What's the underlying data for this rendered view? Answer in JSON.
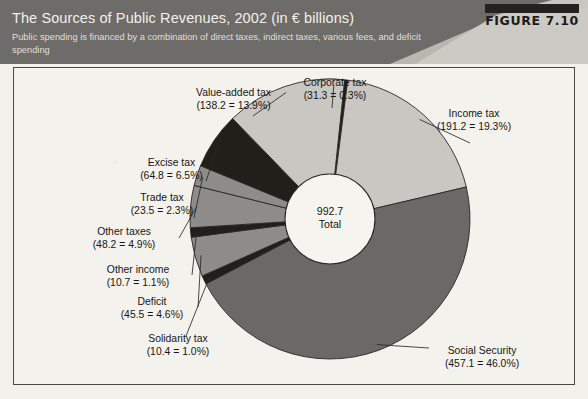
{
  "header": {
    "title": "The Sources of Public Revenues, 2002 (in € billions)",
    "subtitle": "Public spending is financed by a combination of direct taxes, indirect taxes, various fees, and deficit spending",
    "figure_label": "FIGURE 7.10"
  },
  "center": {
    "value": "992.7",
    "caption": "Total"
  },
  "colors": {
    "header_bg": "#6e6c68",
    "header_accent": "#bebbb4",
    "panel_bg": "#f4f2ed",
    "panel_border": "#4a4845",
    "slice_light": "#c9c7c2",
    "slice_black": "#221f1b",
    "slice_mid": "#8e8c88",
    "slice_dark": "#6b6966",
    "hole": "#f6f4ef",
    "outline": "#2a2825",
    "leader": "#2a2825",
    "text": "#181614"
  },
  "chart_data": {
    "type": "pie",
    "variant": "donut",
    "title": "The Sources of Public Revenues, 2002 (in € billions)",
    "subtitle": "Public spending is financed by a combination of direct taxes, indirect taxes, various fees, and deficit spending",
    "units": "€ billions",
    "total": 992.7,
    "total_caption": "Total",
    "legend": "none",
    "labels_position": "outside-with-leader-lines",
    "start_angle_deg": -4,
    "direction": "clockwise",
    "slices": [
      {
        "name": "Corporate tax",
        "value": 31.3,
        "percent": 0.3,
        "label": "Corporate tax",
        "value_text": "(31.3 = 0.3%)",
        "fill": "black",
        "start_deg": -4.0,
        "sweep_deg": 11.3
      },
      {
        "name": "Income tax",
        "value": 191.2,
        "percent": 19.3,
        "label": "Income tax",
        "value_text": "(191.2 = 19.3%)",
        "fill": "light",
        "start_deg": 7.3,
        "sweep_deg": 69.5
      },
      {
        "name": "Social Security",
        "value": 457.1,
        "percent": 46.0,
        "label": "Social Security",
        "value_text": "(457.1 = 46.0%)",
        "fill": "dark",
        "start_deg": 76.8,
        "sweep_deg": 165.6
      },
      {
        "name": "Solidarity tax",
        "value": 10.4,
        "percent": 1.0,
        "label": "Solidarity tax",
        "value_text": "(10.4 = 1.0%)",
        "fill": "black",
        "start_deg": 242.4,
        "sweep_deg": 3.6
      },
      {
        "name": "Deficit",
        "value": 45.5,
        "percent": 4.6,
        "label": "Deficit",
        "value_text": "(45.5 = 4.6%)",
        "fill": "mid",
        "start_deg": 246.0,
        "sweep_deg": 16.5
      },
      {
        "name": "Other income",
        "value": 10.7,
        "percent": 1.1,
        "label": "Other income",
        "value_text": "(10.7 = 1.1%)",
        "fill": "black",
        "start_deg": 262.5,
        "sweep_deg": 3.9
      },
      {
        "name": "Other taxes",
        "value": 48.2,
        "percent": 4.9,
        "label": "Other taxes",
        "value_text": "(48.2 = 4.9%)",
        "fill": "mid",
        "start_deg": 266.4,
        "sweep_deg": 17.5
      },
      {
        "name": "Trade tax",
        "value": 23.5,
        "percent": 2.3,
        "label": "Trade tax",
        "value_text": "(23.5 = 2.3%)",
        "fill": "mid",
        "start_deg": 283.9,
        "sweep_deg": 8.5
      },
      {
        "name": "Excise tax",
        "value": 64.8,
        "percent": 6.5,
        "label": "Excise tax",
        "value_text": "(64.8 = 6.5%)",
        "fill": "black",
        "start_deg": 292.4,
        "sweep_deg": 23.5
      },
      {
        "name": "Value-added tax",
        "value": 138.2,
        "percent": 13.9,
        "label": "Value-added tax",
        "value_text": "(138.2 = 13.9%)",
        "fill": "light",
        "start_deg": 315.9,
        "sweep_deg": 50.1
      }
    ]
  },
  "callouts": {
    "value_added_tax": {
      "label": "Value-added tax",
      "value_text": "(138.2 = 13.9%)"
    },
    "excise_tax": {
      "label": "Excise tax",
      "value_text": "(64.8 = 6.5%)"
    },
    "trade_tax": {
      "label": "Trade tax",
      "value_text": "(23.5 = 2.3%)"
    },
    "other_taxes": {
      "label": "Other taxes",
      "value_text": "(48.2 = 4.9%)"
    },
    "other_income": {
      "label": "Other income",
      "value_text": "(10.7 = 1.1%)"
    },
    "deficit": {
      "label": "Deficit",
      "value_text": "(45.5 = 4.6%)"
    },
    "solidarity_tax": {
      "label": "Solidarity tax",
      "value_text": "(10.4 = 1.0%)"
    },
    "corporate_tax": {
      "label": "Corporate tax",
      "value_text": "(31.3 = 0.3%)"
    },
    "income_tax": {
      "label": "Income tax",
      "value_text": "(191.2 = 19.3%)"
    },
    "social_security": {
      "label": "Social Security",
      "value_text": "(457.1 = 46.0%)"
    }
  }
}
